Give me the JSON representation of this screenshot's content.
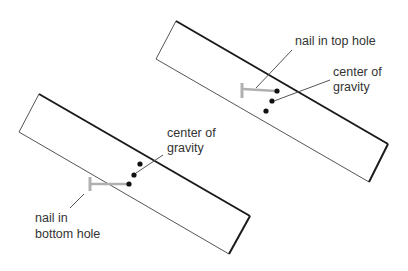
{
  "diagram": {
    "colors": {
      "outline": "#1a1a1a",
      "thin_outline": "#555555",
      "nail": "#b0b0b0",
      "leader": "#555555",
      "dot": "#111111",
      "text": "#333333"
    },
    "top_board": {
      "nail_label_line1": "nail in top hole",
      "cog_label_line1": "center of",
      "cog_label_line2": "gravity"
    },
    "bottom_board": {
      "cog_label_line1": "center of",
      "cog_label_line2": "gravity",
      "nail_label_line1": "nail in",
      "nail_label_line2": "bottom hole"
    }
  }
}
